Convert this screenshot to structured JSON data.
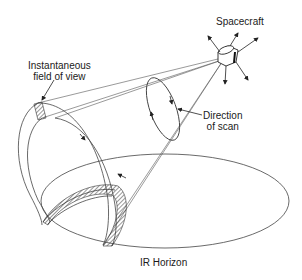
{
  "diagram": {
    "labels": {
      "spacecraft": "Spacecraft",
      "ifov_line1": "Instantaneous",
      "ifov_line2": "field of view",
      "scan_line1": "Direction",
      "scan_line2": "of scan",
      "horizon": "IR Horizon"
    },
    "colors": {
      "line": "#333333",
      "background": "#ffffff"
    }
  }
}
